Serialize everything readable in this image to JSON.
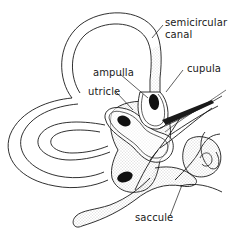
{
  "diagram": {
    "labels": {
      "semicircular_canal_line1": "semicircular",
      "semicircular_canal_line2": "canal",
      "cupula": "cupula",
      "ampulla": "ampulla",
      "utricle": "utricle",
      "saccule": "saccule"
    },
    "colors": {
      "line": "#1a1a1a",
      "fill_dark": "#111111",
      "stipple": "#9a9a9a",
      "background": "#ffffff"
    }
  }
}
